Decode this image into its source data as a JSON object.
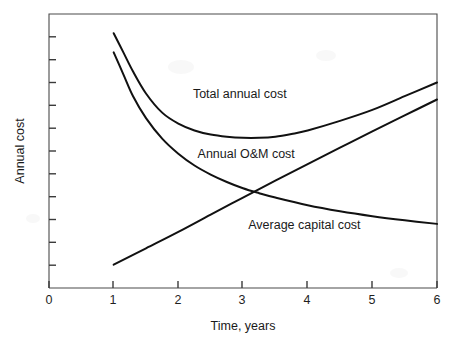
{
  "chart_data": {
    "type": "line",
    "title": "",
    "xlabel": "Time, years",
    "ylabel": "Annual cost",
    "xlim": [
      0,
      6
    ],
    "ylim": [
      0,
      1
    ],
    "grid": false,
    "legend_position": "inline-annotations",
    "x_ticks": [
      0,
      1,
      2,
      3,
      4,
      5,
      6
    ],
    "x_tick_labels": [
      "0",
      "1",
      "2",
      "3",
      "4",
      "5",
      "6"
    ],
    "y_ticks_count": 11,
    "y_tick_labels": [],
    "y_axis_note": "unlabeled tick marks, qualitative scale",
    "series": [
      {
        "name": "Total annual cost",
        "label": "Total annual cost",
        "x": [
          1.0,
          1.15,
          1.3,
          1.5,
          1.75,
          2.0,
          2.25,
          2.5,
          2.75,
          3.0,
          3.25,
          3.5,
          3.75,
          4.0,
          4.5,
          5.0,
          5.5,
          6.0
        ],
        "y": [
          0.93,
          0.86,
          0.79,
          0.71,
          0.64,
          0.6,
          0.575,
          0.56,
          0.552,
          0.548,
          0.548,
          0.552,
          0.562,
          0.575,
          0.61,
          0.65,
          0.7,
          0.75
        ]
      },
      {
        "name": "Average capital cost",
        "label": "Average capital cost",
        "x": [
          1.0,
          1.15,
          1.3,
          1.5,
          1.75,
          2.0,
          2.25,
          2.5,
          2.75,
          3.0,
          3.25,
          3.5,
          4.0,
          4.5,
          5.0,
          5.5,
          6.0
        ],
        "y": [
          0.86,
          0.78,
          0.7,
          0.62,
          0.545,
          0.49,
          0.447,
          0.414,
          0.387,
          0.364,
          0.346,
          0.33,
          0.302,
          0.28,
          0.262,
          0.247,
          0.234
        ]
      },
      {
        "name": "Annual O&M cost",
        "label": "Annual O&M cost",
        "x": [
          1.0,
          1.5,
          2.0,
          2.5,
          3.0,
          3.5,
          4.0,
          4.5,
          5.0,
          5.5,
          6.0
        ],
        "y": [
          0.085,
          0.145,
          0.205,
          0.268,
          0.33,
          0.392,
          0.452,
          0.512,
          0.572,
          0.63,
          0.688
        ]
      }
    ],
    "annotations": [
      {
        "text": "Total annual cost",
        "x": 2.95,
        "y": 0.695
      },
      {
        "text": "Annual O&M cost",
        "x": 3.05,
        "y": 0.475
      },
      {
        "text": "Average capital cost",
        "x": 3.95,
        "y": 0.215
      }
    ],
    "crossover_point": {
      "x": 3.2,
      "y": 0.345
    },
    "minimum_total_cost": {
      "x": 3.1,
      "y": 0.548
    }
  },
  "axis": {
    "x_title": "Time, years",
    "y_title": "Annual cost"
  },
  "colors": {
    "background": "#ffffff",
    "curve": "#111111",
    "axis": "#4a4a4a",
    "text": "#1a1a1a"
  }
}
